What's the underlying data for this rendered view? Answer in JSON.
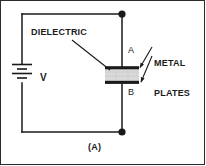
{
  "figure": {
    "caption": "(A)",
    "frame_color": "#2b2b2b",
    "background": "#ffffff",
    "wire_color": "#1a1a1a",
    "dielectric_fill": "#d9d9d9",
    "plate_color": "#1a1a1a"
  },
  "labels": {
    "dielectric": "DIELECTRIC",
    "metal_plates_line1": "METAL",
    "metal_plates_line2": "PLATES",
    "voltage_source": "V",
    "plate_top": "A",
    "plate_bottom": "B"
  },
  "components": [
    {
      "name": "battery",
      "symbol": "dc-voltage-source",
      "label": "V",
      "position": "left-branch"
    },
    {
      "name": "capacitor",
      "symbol": "parallel-plate-capacitor-with-dielectric",
      "top_plate_label": "A",
      "bottom_plate_label": "B",
      "position": "right-branch"
    }
  ],
  "junctions": [
    {
      "name": "top-node",
      "x": 122,
      "y": 14
    },
    {
      "name": "bottom-node",
      "x": 122,
      "y": 132
    }
  ],
  "annotations": [
    {
      "name": "dielectric-leader",
      "from": "DIELECTRIC",
      "to": "dielectric-layer"
    },
    {
      "name": "metal-plates-leader-top",
      "from": "METAL PLATES",
      "to": "plate-A"
    },
    {
      "name": "metal-plates-leader-bottom",
      "from": "METAL PLATES",
      "to": "plate-B"
    }
  ]
}
